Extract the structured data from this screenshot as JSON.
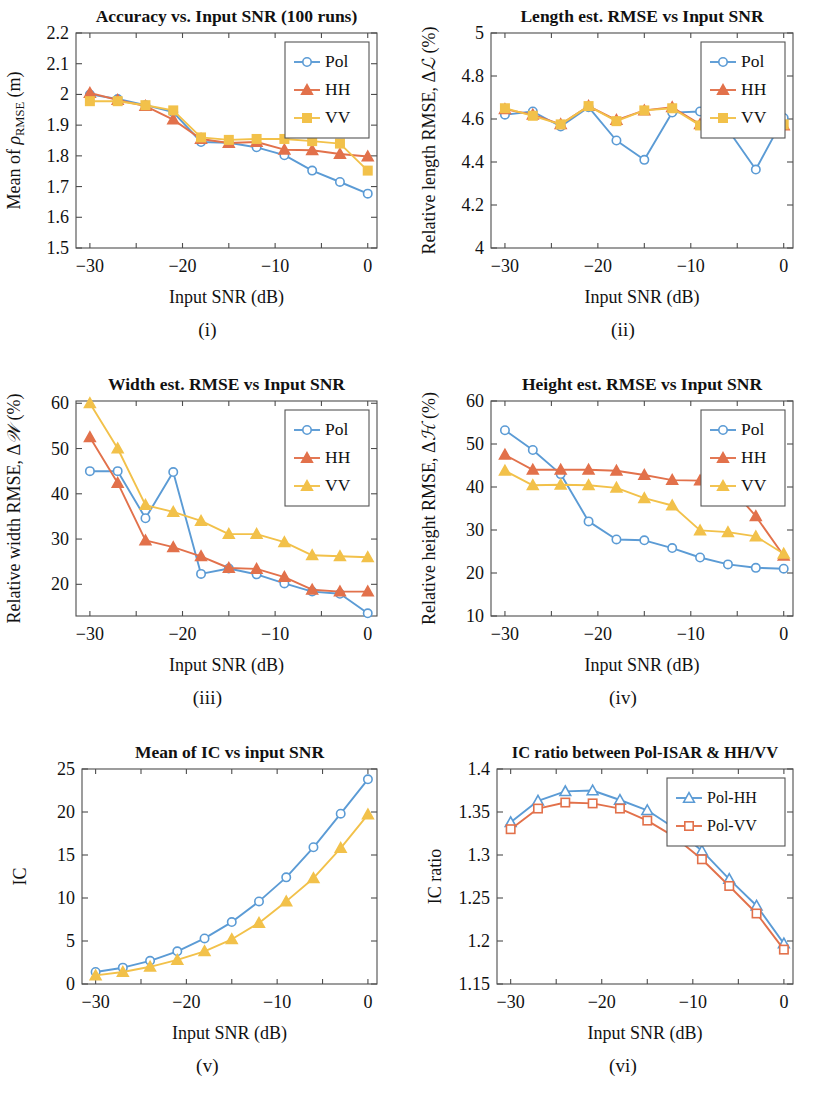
{
  "colors": {
    "pol": "#5B9BD5",
    "hh": "#E2714B",
    "vv": "#F2C14A",
    "axis": "#4d4d4d",
    "text": "#111111",
    "background": "#ffffff"
  },
  "common": {
    "xlabel": "Input SNR (dB)",
    "xticks": [
      -30,
      -20,
      -10,
      0
    ],
    "xticklabels": [
      "−30",
      "−20",
      "−10",
      "0"
    ],
    "xlim": [
      -31.5,
      1.0
    ],
    "snr": [
      -30,
      -27,
      -24,
      -21,
      -18,
      -15,
      -12,
      -9,
      -6,
      -3,
      0
    ]
  },
  "captions": {
    "i": "(i)",
    "ii": "(ii)",
    "iii": "(iii)",
    "iv": "(iv)",
    "v": "(v)",
    "vi": "(vi)"
  },
  "legend_labels": {
    "pol": "Pol",
    "hh": "HH",
    "vv": "VV",
    "pol_hh": "Pol-HH",
    "pol_vv": "Pol-VV"
  },
  "chart_data": [
    {
      "id": "i",
      "type": "line",
      "title": "Accuracy vs. Input SNR (100 runs)",
      "xlabel": "Input SNR (dB)",
      "ylabel": "Mean of ρRMSE (m)",
      "ylabel_parts": {
        "pre": "Mean of ",
        "sym": "ρ",
        "sub": "RMSE",
        "post": " (m)"
      },
      "x": [
        -30,
        -27,
        -24,
        -21,
        -18,
        -15,
        -12,
        -9,
        -6,
        -3,
        0
      ],
      "xlim": [
        -31.5,
        1.0
      ],
      "ylim": [
        1.5,
        2.2
      ],
      "yticks": [
        1.5,
        1.6,
        1.7,
        1.8,
        1.9,
        2.0,
        2.1,
        2.2
      ],
      "yticklabels": [
        "1.5",
        "1.6",
        "1.7",
        "1.8",
        "1.9",
        "2",
        "2.1",
        "2.2"
      ],
      "grid": false,
      "legend_position": "top-right",
      "series": [
        {
          "name": "Pol",
          "marker": "circle",
          "color": "#5B9BD5",
          "values": [
            2.0,
            1.985,
            1.965,
            1.942,
            1.845,
            1.843,
            1.828,
            1.802,
            1.752,
            1.715,
            1.677
          ]
        },
        {
          "name": "HH",
          "marker": "triangle",
          "color": "#E2714B",
          "values": [
            2.005,
            1.982,
            1.962,
            1.918,
            1.855,
            1.842,
            1.845,
            1.82,
            1.818,
            1.806,
            1.798
          ]
        },
        {
          "name": "VV",
          "marker": "square",
          "color": "#F2C14A",
          "values": [
            1.978,
            1.978,
            1.965,
            1.948,
            1.86,
            1.852,
            1.855,
            1.855,
            1.848,
            1.84,
            1.752
          ]
        }
      ]
    },
    {
      "id": "ii",
      "type": "line",
      "title": "Length est. RMSE vs Input SNR",
      "xlabel": "Input SNR (dB)",
      "ylabel": "Relative length RMSE, Δℒ (%)",
      "ylabel_parts": {
        "pre": "Relative length RMSE, Δ",
        "sym": "ℒ",
        "post": " (%)"
      },
      "x": [
        -30,
        -27,
        -24,
        -21,
        -18,
        -15,
        -12,
        -9,
        -6,
        -3,
        0
      ],
      "xlim": [
        -31.5,
        1.0
      ],
      "ylim": [
        4.0,
        5.0
      ],
      "yticks": [
        4.0,
        4.2,
        4.4,
        4.6,
        4.8,
        5.0
      ],
      "yticklabels": [
        "4",
        "4.2",
        "4.4",
        "4.6",
        "4.8",
        "5"
      ],
      "grid": false,
      "legend_position": "top-right",
      "series": [
        {
          "name": "Pol",
          "marker": "circle",
          "color": "#5B9BD5",
          "values": [
            4.62,
            4.635,
            4.565,
            4.655,
            4.5,
            4.41,
            4.63,
            4.635,
            4.55,
            4.365,
            4.605
          ]
        },
        {
          "name": "HH",
          "marker": "triangle",
          "color": "#E2714B",
          "values": [
            4.645,
            4.62,
            4.575,
            4.66,
            4.595,
            4.64,
            4.655,
            4.575,
            4.575,
            4.625,
            4.57
          ]
        },
        {
          "name": "VV",
          "marker": "square",
          "color": "#F2C14A",
          "values": [
            4.65,
            4.615,
            4.575,
            4.66,
            4.59,
            4.64,
            4.65,
            4.57,
            4.57,
            4.625,
            4.575
          ]
        }
      ]
    },
    {
      "id": "iii",
      "type": "line",
      "title": "Width est. RMSE vs Input SNR",
      "xlabel": "Input SNR (dB)",
      "ylabel": "Relative width RMSE, Δ𝒲 (%)",
      "ylabel_parts": {
        "pre": "Relative width RMSE, Δ",
        "sym": "𝒲",
        "post": " (%)"
      },
      "x": [
        -30,
        -27,
        -24,
        -21,
        -18,
        -15,
        -12,
        -9,
        -6,
        -3,
        0
      ],
      "xlim": [
        -31.5,
        1.0
      ],
      "ylim": [
        13.0,
        60.5
      ],
      "yticks": [
        20,
        30,
        40,
        50,
        60
      ],
      "yticklabels": [
        "20",
        "30",
        "40",
        "50",
        "60"
      ],
      "grid": false,
      "legend_position": "top-right",
      "series": [
        {
          "name": "Pol",
          "marker": "circle",
          "color": "#5B9BD5",
          "values": [
            45.0,
            45.0,
            34.6,
            44.8,
            22.3,
            23.5,
            22.2,
            20.2,
            18.4,
            17.9,
            13.6
          ]
        },
        {
          "name": "HH",
          "marker": "triangle",
          "color": "#E2714B",
          "values": [
            52.5,
            42.4,
            29.7,
            28.2,
            26.2,
            23.6,
            23.4,
            21.6,
            18.8,
            18.4,
            18.4
          ]
        },
        {
          "name": "VV",
          "marker": "triangle",
          "color": "#F2C14A",
          "values": [
            60.0,
            50.0,
            37.5,
            36.0,
            34.0,
            31.1,
            31.1,
            29.3,
            26.4,
            26.2,
            26.0
          ]
        }
      ]
    },
    {
      "id": "iv",
      "type": "line",
      "title": "Height est. RMSE vs Input SNR",
      "xlabel": "Input SNR (dB)",
      "ylabel": "Relative height RMSE, Δℋ (%)",
      "ylabel_parts": {
        "pre": "Relative height RMSE, Δ",
        "sym": "ℋ",
        "post": " (%)"
      },
      "x": [
        -30,
        -27,
        -24,
        -21,
        -18,
        -15,
        -12,
        -9,
        -6,
        -3,
        0
      ],
      "xlim": [
        -31.5,
        1.0
      ],
      "ylim": [
        10.0,
        60.0
      ],
      "yticks": [
        10,
        20,
        30,
        40,
        50,
        60
      ],
      "yticklabels": [
        "10",
        "20",
        "30",
        "40",
        "50",
        "60"
      ],
      "grid": false,
      "legend_position": "top-right",
      "series": [
        {
          "name": "Pol",
          "marker": "circle",
          "color": "#5B9BD5",
          "values": [
            53.2,
            48.6,
            43.0,
            32.0,
            27.8,
            27.6,
            25.8,
            23.6,
            22.0,
            21.2,
            21.0
          ]
        },
        {
          "name": "HH",
          "marker": "triangle",
          "color": "#E2714B",
          "values": [
            47.5,
            44.0,
            44.0,
            44.0,
            43.8,
            42.8,
            41.6,
            41.5,
            40.6,
            33.2,
            24.0
          ]
        },
        {
          "name": "VV",
          "marker": "triangle",
          "color": "#F2C14A",
          "values": [
            43.8,
            40.4,
            40.5,
            40.4,
            39.8,
            37.4,
            35.7,
            29.9,
            29.5,
            28.5,
            24.5
          ]
        }
      ]
    },
    {
      "id": "v",
      "type": "line",
      "title": "Mean of IC vs input SNR",
      "xlabel": "Input SNR (dB)",
      "ylabel": "IC",
      "ylabel_parts": {
        "pre": "IC",
        "sym": "",
        "post": ""
      },
      "x": [
        -30,
        -27,
        -24,
        -21,
        -18,
        -15,
        -12,
        -9,
        -6,
        -3,
        0
      ],
      "xlim": [
        -31.5,
        1.0
      ],
      "ylim": [
        0.0,
        25.0
      ],
      "yticks": [
        0,
        5,
        10,
        15,
        20,
        25
      ],
      "yticklabels": [
        "0",
        "5",
        "10",
        "15",
        "20",
        "25"
      ],
      "grid": false,
      "legend_position": "none",
      "series": [
        {
          "name": "Pol",
          "marker": "circle",
          "color": "#5B9BD5",
          "values": [
            1.4,
            1.9,
            2.7,
            3.8,
            5.3,
            7.2,
            9.6,
            12.4,
            15.9,
            19.8,
            23.8
          ]
        },
        {
          "name": "HH/VV",
          "marker": "triangle",
          "color": "#F2C14A",
          "values": [
            1.0,
            1.4,
            2.0,
            2.8,
            3.8,
            5.2,
            7.1,
            9.6,
            12.3,
            15.8,
            19.7
          ]
        }
      ]
    },
    {
      "id": "vi",
      "type": "line",
      "title": "IC ratio between Pol-ISAR & HH/VV",
      "xlabel": "Input SNR (dB)",
      "ylabel": "IC ratio",
      "ylabel_parts": {
        "pre": "IC ratio",
        "sym": "",
        "post": ""
      },
      "x": [
        -30,
        -27,
        -24,
        -21,
        -18,
        -15,
        -12,
        -9,
        -6,
        -3,
        0
      ],
      "xlim": [
        -31.5,
        1.0
      ],
      "ylim": [
        1.15,
        1.4
      ],
      "yticks": [
        1.15,
        1.2,
        1.25,
        1.3,
        1.35,
        1.4
      ],
      "yticklabels": [
        "1.15",
        "1.2",
        "1.25",
        "1.3",
        "1.35",
        "1.4"
      ],
      "grid": false,
      "legend_position": "top-right",
      "series": [
        {
          "name": "Pol-HH",
          "marker": "triangle-open",
          "color": "#5B9BD5",
          "values": [
            1.338,
            1.363,
            1.374,
            1.375,
            1.364,
            1.352,
            1.331,
            1.305,
            1.272,
            1.241,
            1.197
          ]
        },
        {
          "name": "Pol-VV",
          "marker": "square-open",
          "color": "#E2714B",
          "values": [
            1.33,
            1.354,
            1.361,
            1.36,
            1.354,
            1.34,
            1.321,
            1.295,
            1.264,
            1.232,
            1.19
          ]
        }
      ]
    }
  ]
}
